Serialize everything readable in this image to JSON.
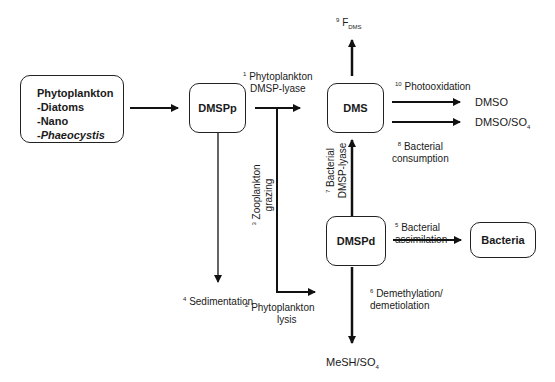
{
  "nodes": {
    "phytoplankton": {
      "title": "Phytoplankton",
      "items": [
        "-Diatoms",
        "-Nano",
        "-"
      ],
      "italic_item": "Phaeocystis"
    },
    "dmspp": "DMSPp",
    "dms": "DMS",
    "dmspd": "DMSPd",
    "bacteria": "Bacteria"
  },
  "processes": [
    {
      "num": "1",
      "line1": "Phytoplankton",
      "line2": "DMSP-lyase"
    },
    {
      "num": "2",
      "line1": "Phytoplankton",
      "line2": "lysis"
    },
    {
      "num": "3",
      "line1": "Zooplankton",
      "line2": "grazing"
    },
    {
      "num": "4",
      "line1": "Sedimentation"
    },
    {
      "num": "5",
      "line1": "Bacterial",
      "line2": "assimilation"
    },
    {
      "num": "6",
      "line1": "Demethylation/",
      "line2": "demetiolation"
    },
    {
      "num": "7",
      "line1": "Bacterial",
      "line2": "DMSP-lyase"
    },
    {
      "num": "8",
      "line1": "Bacterial",
      "line2": "consumption"
    },
    {
      "num": "9",
      "main": "F",
      "sub": "DMS"
    },
    {
      "num": "10",
      "line1": "Photooxidation"
    }
  ],
  "products": {
    "dmso": "DMSO",
    "dmso_so4_main": "DMSO/SO",
    "dmso_so4_sub": "4",
    "mesh_main": "MeSH/SO",
    "mesh_sub": "4"
  }
}
